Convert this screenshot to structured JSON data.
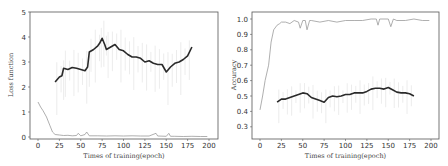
{
  "chart_data": [
    {
      "type": "line",
      "title": "",
      "xlabel": "Times of training(epoch)",
      "ylabel": "Loss function",
      "xlim": [
        -8,
        210
      ],
      "ylim": [
        0,
        5
      ],
      "xticks": [
        0,
        25,
        50,
        75,
        100,
        125,
        150,
        175,
        200
      ],
      "yticks": [
        0,
        1,
        2,
        3,
        4,
        5
      ],
      "grid": false,
      "legend": null,
      "series": [
        {
          "name": "training loss (raw)",
          "style": "thin gray",
          "x": [
            0,
            3,
            6,
            10,
            14,
            17,
            20,
            25,
            30,
            35,
            40,
            45,
            47,
            50,
            55,
            57,
            60,
            70,
            80,
            90,
            100,
            110,
            120,
            130,
            138,
            140,
            150,
            153,
            155,
            160,
            170,
            180,
            190,
            198
          ],
          "values": [
            1.4,
            1.2,
            1.05,
            0.8,
            0.45,
            0.2,
            0.1,
            0.08,
            0.06,
            0.07,
            0.05,
            0.06,
            0.15,
            0.05,
            0.1,
            0.2,
            0.05,
            0.05,
            0.04,
            0.05,
            0.04,
            0.05,
            0.04,
            0.04,
            0.15,
            0.04,
            0.03,
            0.15,
            0.03,
            0.03,
            0.02,
            0.03,
            0.02,
            0.02
          ]
        },
        {
          "name": "validation loss (smoothed)",
          "style": "thick black",
          "x": [
            20,
            25,
            28,
            30,
            35,
            40,
            45,
            50,
            55,
            58,
            60,
            65,
            70,
            72,
            75,
            78,
            80,
            85,
            90,
            95,
            100,
            105,
            110,
            115,
            120,
            125,
            130,
            135,
            140,
            145,
            150,
            155,
            160,
            165,
            170,
            175,
            180
          ],
          "values": [
            2.2,
            2.4,
            2.45,
            2.75,
            2.7,
            2.78,
            2.75,
            2.7,
            2.65,
            2.8,
            3.4,
            3.5,
            3.65,
            3.75,
            3.95,
            3.7,
            3.5,
            3.6,
            3.7,
            3.5,
            3.45,
            3.3,
            3.2,
            3.2,
            3.15,
            3.0,
            3.05,
            2.95,
            2.9,
            2.9,
            2.6,
            2.8,
            2.95,
            3.0,
            3.1,
            3.25,
            3.6
          ]
        }
      ]
    },
    {
      "type": "line",
      "title": "",
      "xlabel": "Times of training(epoch)",
      "ylabel": "Accuracy",
      "xlim": [
        -8,
        210
      ],
      "ylim": [
        0.23,
        1.03
      ],
      "xticks": [
        0,
        25,
        50,
        75,
        100,
        125,
        150,
        175,
        200
      ],
      "yticks": [
        0.3,
        0.4,
        0.5,
        0.6,
        0.7,
        0.8,
        0.9,
        1.0
      ],
      "grid": false,
      "legend": null,
      "series": [
        {
          "name": "training accuracy (raw)",
          "style": "thin gray",
          "x": [
            0,
            3,
            6,
            10,
            13,
            16,
            20,
            23,
            25,
            30,
            35,
            40,
            45,
            47,
            50,
            53,
            55,
            58,
            60,
            70,
            80,
            90,
            100,
            110,
            120,
            130,
            136,
            138,
            140,
            150,
            153,
            156,
            160,
            170,
            180,
            190,
            198
          ],
          "values": [
            0.41,
            0.5,
            0.6,
            0.7,
            0.85,
            0.93,
            0.96,
            0.97,
            0.98,
            0.98,
            0.97,
            0.99,
            0.98,
            0.94,
            0.99,
            0.99,
            0.93,
            0.99,
            0.99,
            0.98,
            0.99,
            0.98,
            0.99,
            0.99,
            0.99,
            1.0,
            1.0,
            0.96,
            1.0,
            1.0,
            0.95,
            1.0,
            0.99,
            0.99,
            1.0,
            0.99,
            0.99
          ]
        },
        {
          "name": "validation accuracy (smoothed)",
          "style": "thick black",
          "x": [
            20,
            25,
            30,
            35,
            40,
            45,
            50,
            55,
            60,
            65,
            70,
            75,
            80,
            85,
            90,
            95,
            100,
            105,
            110,
            115,
            120,
            125,
            130,
            135,
            140,
            145,
            150,
            155,
            160,
            165,
            170,
            175,
            180
          ],
          "values": [
            0.46,
            0.48,
            0.48,
            0.49,
            0.5,
            0.51,
            0.52,
            0.515,
            0.49,
            0.48,
            0.47,
            0.46,
            0.49,
            0.5,
            0.495,
            0.5,
            0.51,
            0.51,
            0.52,
            0.52,
            0.52,
            0.53,
            0.545,
            0.55,
            0.55,
            0.545,
            0.555,
            0.54,
            0.525,
            0.52,
            0.52,
            0.515,
            0.5
          ]
        }
      ]
    }
  ]
}
